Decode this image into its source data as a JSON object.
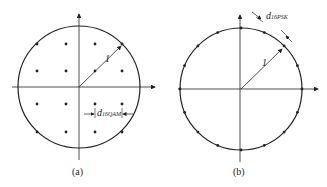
{
  "figure": {
    "panels": [
      {
        "id": "a",
        "caption": "(a)",
        "type": "16QAM constellation",
        "radius_label": "1",
        "distance_label": "d",
        "distance_subscript": "16QAM",
        "grid_points": 16
      },
      {
        "id": "b",
        "caption": "(b)",
        "type": "16PSK constellation",
        "radius_label": "1",
        "distance_label": "d",
        "distance_subscript": "16PSK",
        "circle_points": 16
      }
    ]
  }
}
